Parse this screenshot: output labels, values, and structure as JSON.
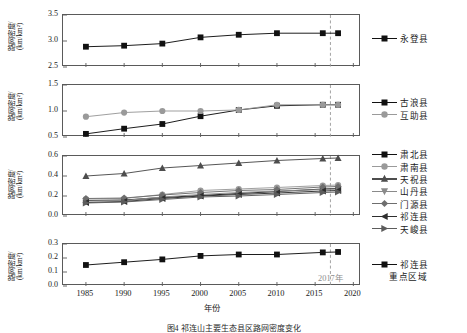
{
  "figure": {
    "caption": "图4  祁连山主要生态县区路网密度变化",
    "xaxis_title": "年份",
    "yaxis_title_line1": "路网密度/",
    "yaxis_title_line2": "(km/km²)",
    "annotation_2017": "2017年",
    "dashed_year": 2017
  },
  "chart_data": {
    "type": "line",
    "title": "祁连山主要生态县区路网密度变化",
    "xlabel": "年份",
    "ylabel": "路网密度/(km/km²)",
    "x": [
      1985,
      1990,
      1995,
      2000,
      2005,
      2010,
      2016,
      2018
    ],
    "xlim": [
      1982,
      2021
    ],
    "xticks": [
      1985,
      1990,
      1995,
      2000,
      2005,
      2010,
      2015,
      2020
    ],
    "grid": false,
    "legend_position": "right",
    "annotations": [
      {
        "text": "2017年",
        "x": 2017,
        "type": "vertical-dashed-line"
      }
    ],
    "panels": [
      {
        "index": 1,
        "ylim": [
          2.5,
          3.5
        ],
        "yticks": [
          2.5,
          3.0,
          3.5
        ],
        "ytick_labels": [
          "2.5",
          "3.0",
          "3.5"
        ],
        "series": [
          {
            "name": "永登县",
            "marker": "square",
            "color": "#111111",
            "values": [
              2.89,
              2.91,
              2.95,
              3.07,
              3.12,
              3.15,
              3.15,
              3.15
            ]
          }
        ]
      },
      {
        "index": 2,
        "ylim": [
          0.5,
          1.5
        ],
        "yticks": [
          0.5,
          1.0,
          1.5
        ],
        "ytick_labels": [
          "0.5",
          "1.0",
          "1.5"
        ],
        "series": [
          {
            "name": "古浪县",
            "marker": "square",
            "color": "#111111",
            "values": [
              0.56,
              0.66,
              0.75,
              0.9,
              1.02,
              1.1,
              1.12,
              1.12
            ]
          },
          {
            "name": "互助县",
            "marker": "circle",
            "color": "#9a9a9a",
            "values": [
              0.89,
              0.97,
              1.0,
              1.0,
              1.02,
              1.12,
              1.12,
              1.12
            ]
          }
        ]
      },
      {
        "index": 3,
        "ylim": [
          0.0,
          0.6
        ],
        "yticks": [
          0.0,
          0.2,
          0.4,
          0.6
        ],
        "ytick_labels": [
          "0.0",
          "0.2",
          "0.4",
          "0.6"
        ],
        "series": [
          {
            "name": "肃北县",
            "marker": "square",
            "color": "#111111",
            "values": [
              0.155,
              0.16,
              0.185,
              0.205,
              0.225,
              0.245,
              0.27,
              0.275
            ]
          },
          {
            "name": "肃南县",
            "marker": "circle",
            "color": "#9a9a9a",
            "values": [
              0.17,
              0.175,
              0.215,
              0.255,
              0.27,
              0.285,
              0.305,
              0.31
            ]
          },
          {
            "name": "天祝县",
            "marker": "triangle-up",
            "color": "#4d4d4d",
            "values": [
              0.4,
              0.425,
              0.48,
              0.505,
              0.53,
              0.555,
              0.575,
              0.58
            ]
          },
          {
            "name": "山丹县",
            "marker": "triangle-down",
            "color": "#8a8a8a",
            "values": [
              0.15,
              0.155,
              0.19,
              0.215,
              0.235,
              0.25,
              0.265,
              0.27
            ]
          },
          {
            "name": "门源县",
            "marker": "diamond",
            "color": "#6e6e6e",
            "values": [
              0.175,
              0.18,
              0.21,
              0.235,
              0.255,
              0.265,
              0.29,
              0.295
            ]
          },
          {
            "name": "祁连县",
            "marker": "triangle-left",
            "color": "#2e2e2e",
            "values": [
              0.135,
              0.145,
              0.175,
              0.2,
              0.215,
              0.23,
              0.25,
              0.255
            ]
          },
          {
            "name": "天峻县",
            "marker": "triangle-right",
            "color": "#5c5c5c",
            "values": [
              0.13,
              0.14,
              0.165,
              0.19,
              0.2,
              0.215,
              0.235,
              0.24
            ]
          }
        ]
      },
      {
        "index": 4,
        "ylim": [
          0.0,
          0.3
        ],
        "yticks": [
          0.0,
          0.1,
          0.2,
          0.3
        ],
        "ytick_labels": [
          "0.0",
          "0.1",
          "0.2",
          "0.3"
        ],
        "series": [
          {
            "name": "祁连县重点区域",
            "marker": "square",
            "color": "#111111",
            "values": [
              0.15,
              0.17,
              0.19,
              0.215,
              0.225,
              0.225,
              0.24,
              0.243
            ]
          }
        ]
      }
    ],
    "legend_groups": [
      {
        "panel": 1,
        "entries": [
          {
            "label": "永登县",
            "marker": "square",
            "color": "#111111"
          }
        ]
      },
      {
        "panel": 2,
        "entries": [
          {
            "label": "古浪县",
            "marker": "square",
            "color": "#111111"
          },
          {
            "label": "互助县",
            "marker": "circle",
            "color": "#9a9a9a"
          }
        ]
      },
      {
        "panel": 3,
        "entries": [
          {
            "label": "肃北县",
            "marker": "square",
            "color": "#111111"
          },
          {
            "label": "肃南县",
            "marker": "circle",
            "color": "#9a9a9a"
          },
          {
            "label": "天祝县",
            "marker": "triangle-up",
            "color": "#4d4d4d"
          },
          {
            "label": "山丹县",
            "marker": "triangle-down",
            "color": "#8a8a8a"
          },
          {
            "label": "门源县",
            "marker": "diamond",
            "color": "#6e6e6e"
          },
          {
            "label": "祁连县",
            "marker": "triangle-left",
            "color": "#2e2e2e"
          },
          {
            "label": "天峻县",
            "marker": "triangle-right",
            "color": "#5c5c5c"
          }
        ]
      },
      {
        "panel": 4,
        "entries": [
          {
            "label": "祁连县",
            "marker": "square",
            "color": "#111111",
            "sublabel": "重点区域"
          }
        ]
      }
    ]
  }
}
